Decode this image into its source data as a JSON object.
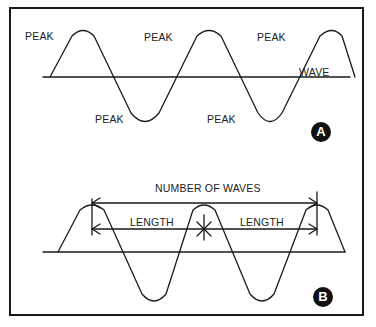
{
  "panel_a": {
    "badge": "A",
    "labels": {
      "peak_1": "PEAK",
      "peak_2": "PEAK",
      "peak_3": "PEAK",
      "trough_1": "PEAK",
      "trough_2": "PEAK",
      "wave": "WAVE"
    }
  },
  "panel_b": {
    "badge": "B",
    "labels": {
      "number_of_waves": "NUMBER OF WAVES",
      "length_1": "LENGTH",
      "length_2": "LENGTH"
    }
  },
  "colors": {
    "stroke": "#1a1a1a",
    "badge_bg": "#111111",
    "badge_text": "#ffffff"
  }
}
